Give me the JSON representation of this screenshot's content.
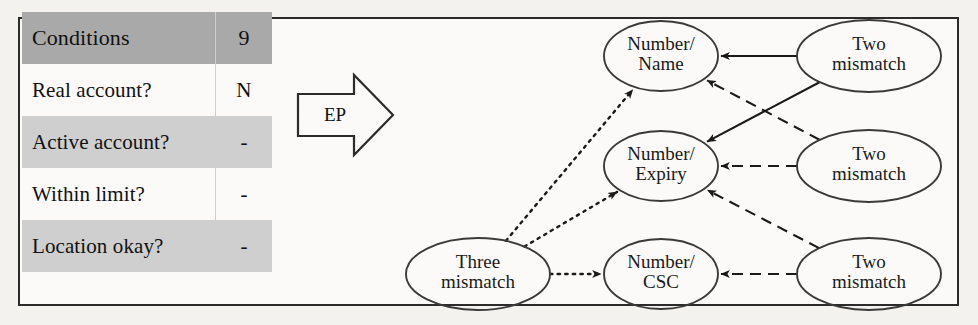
{
  "diagram": {
    "frame_border_color": "#2b2b2b",
    "background_color": "#fbfaf8"
  },
  "table": {
    "header": {
      "label": "Conditions",
      "value": "9",
      "row_color": "#a9a9a9"
    },
    "shade_color": "#cfcfcf",
    "rows": [
      {
        "label": "Real account?",
        "value": "N",
        "shaded": false
      },
      {
        "label": "Active account?",
        "value": "-",
        "shaded": true
      },
      {
        "label": "Within limit?",
        "value": "-",
        "shaded": false
      },
      {
        "label": "Location okay?",
        "value": "-",
        "shaded": true
      }
    ]
  },
  "transform": {
    "arrow_label": "EP",
    "icon": "right-block-arrow-icon"
  },
  "graph": {
    "nodes": [
      {
        "id": "three-mismatch",
        "line1": "Three",
        "line2": "mismatch",
        "cx": 478,
        "cy": 274,
        "rx": 72,
        "ry": 36
      },
      {
        "id": "number-name",
        "line1": "Number/",
        "line2": "Name",
        "cx": 661,
        "cy": 56,
        "rx": 57,
        "ry": 35
      },
      {
        "id": "number-expiry",
        "line1": "Number/",
        "line2": "Expiry",
        "cx": 661,
        "cy": 166,
        "rx": 57,
        "ry": 35
      },
      {
        "id": "number-csc",
        "line1": "Number/",
        "line2": "CSC",
        "cx": 661,
        "cy": 274,
        "rx": 57,
        "ry": 35
      },
      {
        "id": "two-mismatch-1",
        "line1": "Two",
        "line2": "mismatch",
        "cx": 869,
        "cy": 56,
        "rx": 72,
        "ry": 36
      },
      {
        "id": "two-mismatch-2",
        "line1": "Two",
        "line2": "mismatch",
        "cx": 869,
        "cy": 166,
        "rx": 72,
        "ry": 36
      },
      {
        "id": "two-mismatch-3",
        "line1": "Two",
        "line2": "mismatch",
        "cx": 869,
        "cy": 274,
        "rx": 72,
        "ry": 36
      }
    ],
    "edges": [
      {
        "id": "e1",
        "from": "three-mismatch",
        "to": "number-name",
        "style": "dotted"
      },
      {
        "id": "e2",
        "from": "three-mismatch",
        "to": "number-expiry",
        "style": "dotted"
      },
      {
        "id": "e3",
        "from": "three-mismatch",
        "to": "number-csc",
        "style": "dotted"
      },
      {
        "id": "e4",
        "from": "two-mismatch-1",
        "to": "number-name",
        "style": "solid"
      },
      {
        "id": "e5",
        "from": "two-mismatch-1",
        "to": "number-expiry",
        "style": "solid"
      },
      {
        "id": "e6",
        "from": "two-mismatch-2",
        "to": "number-name",
        "style": "dashed"
      },
      {
        "id": "e7",
        "from": "two-mismatch-2",
        "to": "number-expiry",
        "style": "dashed"
      },
      {
        "id": "e8",
        "from": "two-mismatch-3",
        "to": "number-expiry",
        "style": "dashed"
      },
      {
        "id": "e9",
        "from": "two-mismatch-3",
        "to": "number-csc",
        "style": "dashed"
      }
    ],
    "edge_color": "#1a1a1a"
  }
}
